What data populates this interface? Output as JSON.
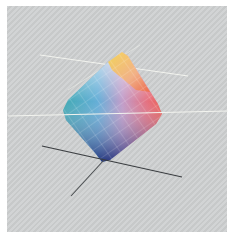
{
  "figure": {
    "background_color": "#cdcfd0",
    "border_color": "#ffffff",
    "colors": {
      "yellow": "#f5d24a",
      "red": "#e8463c",
      "cyan": "#1f9aa6",
      "blue": "#2b3f8f",
      "magenta": "#a0447a",
      "white": "#f4f0f2",
      "axis_dark": "#3a3d40",
      "axis_light": "#f3f4ef"
    }
  }
}
